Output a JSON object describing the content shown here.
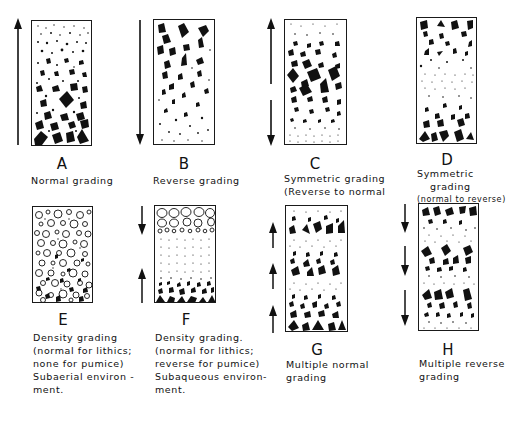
{
  "figure": {
    "panels": [
      {
        "id": "A",
        "letter": "A",
        "caption": [
          "Normal grading"
        ],
        "arrows": [
          "up"
        ]
      },
      {
        "id": "B",
        "letter": "B",
        "caption": [
          "Reverse grading"
        ],
        "arrows": [
          "down"
        ]
      },
      {
        "id": "C",
        "letter": "C",
        "caption": [
          "Symmetric grading",
          "(Reverse to normal"
        ],
        "arrows": [
          "up-down"
        ]
      },
      {
        "id": "D",
        "letter": "D",
        "caption": [
          "Symmetric",
          "grading"
        ],
        "subcaption": "(normal to reverse)",
        "arrows": []
      },
      {
        "id": "E",
        "letter": "E",
        "caption": [
          "Density grading",
          "(normal for lithics;",
          "none for pumice)",
          "Subaerial environ -",
          "ment."
        ],
        "arrows": []
      },
      {
        "id": "F",
        "letter": "F",
        "caption": [
          "Density grading.",
          "(normal for lithics;",
          "reverse for pumice)",
          "Subaqueous environ-",
          "ment."
        ],
        "arrows": [
          "down",
          "up"
        ]
      },
      {
        "id": "G",
        "letter": "G",
        "caption": [
          "Multiple normal",
          "grading"
        ],
        "arrows": [
          "up",
          "up",
          "up"
        ]
      },
      {
        "id": "H",
        "letter": "H",
        "caption": [
          "Multiple reverse",
          "grading"
        ],
        "arrows": [
          "down",
          "down",
          "down"
        ]
      }
    ]
  },
  "colors": {
    "ink": "#111111",
    "background": "#ffffff"
  }
}
